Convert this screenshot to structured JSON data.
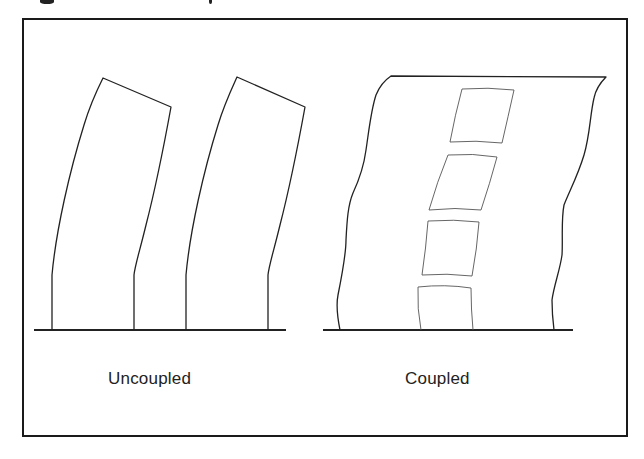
{
  "figure": {
    "labels": {
      "uncoupled": "Uncoupled",
      "coupled": "Coupled"
    },
    "panels": [
      {
        "id": "uncoupled",
        "label": "Uncoupled",
        "elements": [
          "two separate curved wall columns",
          "ground line"
        ]
      },
      {
        "id": "coupled",
        "label": "Coupled",
        "elements": [
          "single deformed wall with wavy edges",
          "four stacked openings",
          "ground line"
        ]
      }
    ],
    "colors": {
      "stroke": "#222222",
      "opening_stroke": "#555555",
      "frame": "#1a1a1a",
      "background": "#ffffff"
    }
  }
}
